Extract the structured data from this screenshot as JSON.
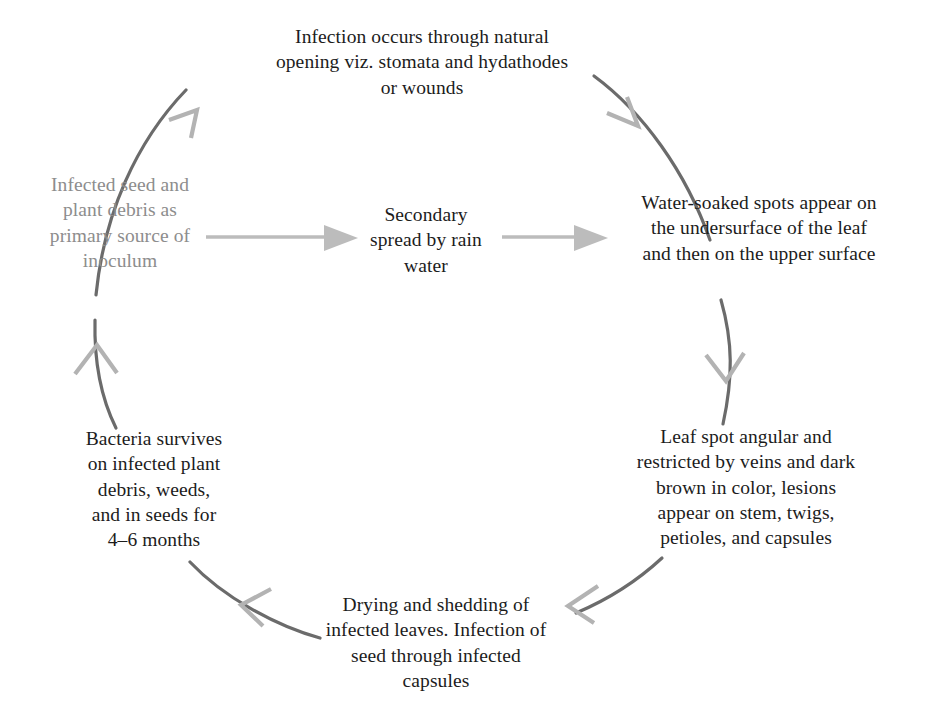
{
  "diagram": {
    "type": "cycle",
    "colors": {
      "arc": "#6b6b6b",
      "arrowhead": "#b3b3b3",
      "straight_arrow": "#b8b8b8",
      "text": "#1c1c1c",
      "text_muted": "#8d8d8d",
      "background": "#ffffff"
    },
    "nodes": [
      {
        "id": "infection",
        "position": "top",
        "text": "Infection occurs through natural\nopening viz. stomata and hydathodes\nor wounds",
        "muted": false
      },
      {
        "id": "water-soaked-spots",
        "position": "right",
        "text": "Water-soaked spots appear on\nthe undersurface of the leaf\nand then on the upper surface",
        "muted": false
      },
      {
        "id": "leaf-spot-angular",
        "position": "bottom-right",
        "text": "Leaf spot angular and\nrestricted by veins and dark\nbrown in color, lesions\nappear on stem, twigs,\npetioles, and capsules",
        "muted": false
      },
      {
        "id": "drying-shedding",
        "position": "bottom",
        "text": "Drying and shedding of\ninfected leaves. Infection of\nseed through infected\ncapsules",
        "muted": false
      },
      {
        "id": "bacteria-survives",
        "position": "bottom-left",
        "text": "Bacteria survives\non infected plant\ndebris, weeds,\nand in seeds for\n4–6 months",
        "muted": false
      },
      {
        "id": "primary-inoculum",
        "position": "left",
        "text": "Infected seed and\nplant debris as\nprimary source of\ninoculum",
        "muted": true
      },
      {
        "id": "secondary-spread",
        "position": "center",
        "text": "Secondary\nspread by rain\nwater",
        "muted": false
      }
    ],
    "connections": [
      {
        "id": "arc-left-to-top",
        "from": "primary-inoculum",
        "to": "infection",
        "style": "curved-arc",
        "direction": "clockwise"
      },
      {
        "id": "arc-top-to-right",
        "from": "infection",
        "to": "water-soaked-spots",
        "style": "curved-arc",
        "direction": "clockwise"
      },
      {
        "id": "arc-right-to-bottomright",
        "from": "water-soaked-spots",
        "to": "leaf-spot-angular",
        "style": "curved-arc",
        "direction": "clockwise"
      },
      {
        "id": "arc-bottomright-to-bottom",
        "from": "leaf-spot-angular",
        "to": "drying-shedding",
        "style": "curved-arc",
        "direction": "clockwise"
      },
      {
        "id": "arc-bottom-to-bottomleft",
        "from": "drying-shedding",
        "to": "bacteria-survives",
        "style": "curved-arc",
        "direction": "clockwise"
      },
      {
        "id": "arc-bottomleft-to-left",
        "from": "bacteria-survives",
        "to": "primary-inoculum",
        "style": "curved-arc",
        "direction": "clockwise"
      },
      {
        "id": "arrow-left-to-center",
        "from": "primary-inoculum",
        "to": "secondary-spread",
        "style": "straight",
        "direction": "right"
      },
      {
        "id": "arrow-center-to-right",
        "from": "secondary-spread",
        "to": "water-soaked-spots",
        "style": "straight",
        "direction": "right"
      }
    ]
  }
}
